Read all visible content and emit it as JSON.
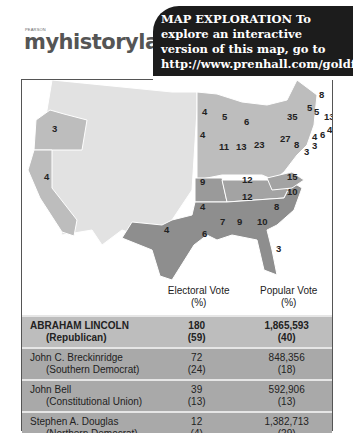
{
  "logo": {
    "publisher": "PEARSON",
    "brand": "myhistorylab"
  },
  "callout": {
    "text": "MAP EXPLORATION  To explore an interactive version of this map, go to http://www.prenhall.com/goldfield5/map14.2"
  },
  "map": {
    "colors": {
      "lincoln": "#bdbdbd",
      "breckinridge": "#8e8e8e",
      "bell": "#a3a3a3",
      "douglas": "#9a9a9a",
      "territory": "#e2e2e2"
    },
    "state_labels": [
      {
        "state": "Oregon",
        "ev": "3"
      },
      {
        "state": "California",
        "ev": "4"
      },
      {
        "state": "Minnesota",
        "ev": "4"
      },
      {
        "state": "Wisconsin",
        "ev": "5"
      },
      {
        "state": "Michigan",
        "ev": "6"
      },
      {
        "state": "Iowa",
        "ev": "4"
      },
      {
        "state": "Illinois",
        "ev": "11"
      },
      {
        "state": "Indiana",
        "ev": "13"
      },
      {
        "state": "Ohio",
        "ev": "23"
      },
      {
        "state": "Pennsylvania",
        "ev": "27"
      },
      {
        "state": "New York",
        "ev": "35"
      },
      {
        "state": "Vermont",
        "ev": "5"
      },
      {
        "state": "New Hampshire",
        "ev": "5"
      },
      {
        "state": "Maine",
        "ev": "8"
      },
      {
        "state": "Massachusetts",
        "ev": "13"
      },
      {
        "state": "Rhode Island",
        "ev": "4"
      },
      {
        "state": "Connecticut",
        "ev": "6"
      },
      {
        "state": "New Jersey",
        "ev": "4"
      },
      {
        "state": "Delaware",
        "ev": "3"
      },
      {
        "state": "Maryland",
        "ev": "8"
      },
      {
        "state": "Missouri",
        "ev": "9"
      },
      {
        "state": "Kentucky",
        "ev": "12"
      },
      {
        "state": "Virginia",
        "ev": "15"
      },
      {
        "state": "Tennessee",
        "ev": "12"
      },
      {
        "state": "North Carolina",
        "ev": "10"
      },
      {
        "state": "Arkansas",
        "ev": "4"
      },
      {
        "state": "South Carolina",
        "ev": "8"
      },
      {
        "state": "Mississippi",
        "ev": "7"
      },
      {
        "state": "Alabama",
        "ev": "9"
      },
      {
        "state": "Georgia",
        "ev": "10"
      },
      {
        "state": "Louisiana",
        "ev": "6"
      },
      {
        "state": "Texas",
        "ev": "4"
      },
      {
        "state": "Florida",
        "ev": "3"
      },
      {
        "state": "Delaware2",
        "ev": "3"
      }
    ]
  },
  "table": {
    "headers": {
      "electoral": "Electoral Vote",
      "electoral_unit": "(%)",
      "popular": "Popular Vote",
      "popular_unit": "(%)"
    },
    "rows": [
      {
        "name": "ABRAHAM LINCOLN",
        "party": "(Republican)",
        "ev": "180",
        "ev_pct": "(59)",
        "pv": "1,865,593",
        "pv_pct": "(40)"
      },
      {
        "name": "John C. Breckinridge",
        "party": "(Southern Democrat)",
        "ev": "72",
        "ev_pct": "(24)",
        "pv": "848,356",
        "pv_pct": "(18)"
      },
      {
        "name": "John Bell",
        "party": "(Constitutional Union)",
        "ev": "39",
        "ev_pct": "(13)",
        "pv": "592,906",
        "pv_pct": "(13)"
      },
      {
        "name": "Stephen A. Douglas",
        "party": "(Northern Democrat)",
        "ev": "12",
        "ev_pct": "(4)",
        "pv": "1,382,713",
        "pv_pct": "(29)"
      }
    ]
  }
}
